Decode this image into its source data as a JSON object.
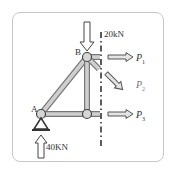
{
  "diagram": {
    "type": "truss-free-body",
    "nodes": [
      {
        "id": "A",
        "label": "A",
        "x": 41,
        "y": 114
      },
      {
        "id": "B",
        "label": "B",
        "x": 87,
        "y": 57
      },
      {
        "id": "C",
        "label": "",
        "x": 87,
        "y": 114
      }
    ],
    "members": [
      [
        "A",
        "B"
      ],
      [
        "B",
        "C"
      ],
      [
        "A",
        "C"
      ]
    ],
    "cut_line": {
      "style": "dash-dot",
      "x": 101
    },
    "loads": {
      "top": {
        "label": "20kN",
        "direction": "down",
        "at": "B"
      },
      "reaction": {
        "label": "40KN",
        "direction": "up",
        "at": "A"
      }
    },
    "member_forces": [
      {
        "name": "P",
        "sub": "1",
        "direction": "right"
      },
      {
        "name": "P",
        "sub": "2",
        "direction": "down-right"
      },
      {
        "name": "P",
        "sub": "3",
        "direction": "right"
      }
    ],
    "support": {
      "type": "pin",
      "at": "A"
    },
    "colors": {
      "member_fill": "#c8c8c8",
      "member_edge": "#777777",
      "node_fill": "#d6d6d6",
      "line": "#444444",
      "frame": "#c8c8c8"
    }
  }
}
